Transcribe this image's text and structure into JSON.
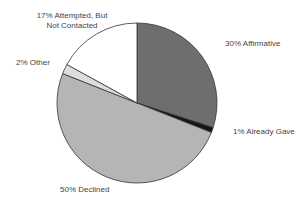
{
  "chart_data": {
    "type": "pie",
    "title": "",
    "start_angle_deg": 0,
    "direction": "clockwise",
    "slices": [
      {
        "label": "Affirmative",
        "value": 30,
        "display": "30%  Affirmative",
        "color": "#6e6e6e"
      },
      {
        "label": "Already Gave",
        "value": 1,
        "display": "1% Already Gave",
        "color": "#151515"
      },
      {
        "label": "Declined",
        "value": 50,
        "display": "50% Declined",
        "color": "#b5b5b5"
      },
      {
        "label": "Other",
        "value": 2,
        "display": "2% Other",
        "color": "#dddddd"
      },
      {
        "label": "Attempted, But Not Contacted",
        "value": 17,
        "display": "17% Attempted, But Not Contacted",
        "color": "#ffffff"
      }
    ],
    "legend": "none (direct labels)"
  },
  "labels": {
    "affirmative": "30%  Affirmative",
    "already_gave": "1% Already Gave",
    "declined": "50% Declined",
    "other": "2% Other",
    "attempted_line1": "17% Attempted, But",
    "attempted_line2": "Not Contacted"
  }
}
